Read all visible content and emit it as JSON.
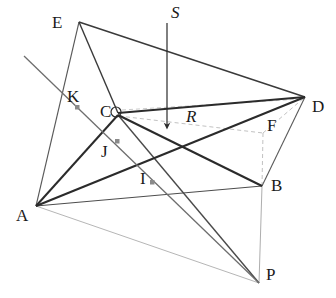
{
  "figure": {
    "type": "line-diagram",
    "width": 336,
    "height": 298,
    "background_color": "#ffffff",
    "colors": {
      "solid_line": "#2b2b2b",
      "thin_line": "#6b6b6b",
      "faint_line": "#b0b0b0",
      "dashed_line": "#bdbdbd",
      "marker_fill": "#8a8a8a",
      "label_color": "#1a1a1a"
    },
    "vertices": [
      {
        "name": "E",
        "label": "E",
        "x": 79,
        "y": 22,
        "label_x": 52,
        "label_y": 14,
        "kind": "apex"
      },
      {
        "name": "C",
        "label": "C",
        "x": 118,
        "y": 113,
        "label_x": 100,
        "label_y": 103,
        "kind": "corner"
      },
      {
        "name": "D",
        "label": "D",
        "x": 305,
        "y": 97,
        "label_x": 312,
        "label_y": 98,
        "kind": "corner"
      },
      {
        "name": "B",
        "label": "B",
        "x": 262,
        "y": 186,
        "label_x": 271,
        "label_y": 177,
        "kind": "corner"
      },
      {
        "name": "A",
        "label": "A",
        "x": 36,
        "y": 206,
        "label_x": 16,
        "label_y": 207,
        "kind": "corner"
      },
      {
        "name": "P",
        "label": "P",
        "x": 259,
        "y": 283,
        "label_x": 266,
        "label_y": 266,
        "kind": "corner"
      },
      {
        "name": "F",
        "label": "F",
        "x": 263,
        "y": 133,
        "label_x": 267,
        "label_y": 117,
        "kind": "hidden-corner"
      },
      {
        "name": "R",
        "label": "R",
        "x": 190,
        "y": 121,
        "label_x": 186,
        "label_y": 108,
        "kind": "point"
      },
      {
        "name": "S",
        "label": "S",
        "x": 167,
        "y": 23,
        "label_x": 171,
        "label_y": 4,
        "kind": "arrow-tail"
      }
    ],
    "interior_points": [
      {
        "name": "K",
        "label": "K",
        "x": 77,
        "y": 107,
        "label_x": 67,
        "label_y": 88,
        "marker": "gray-square"
      },
      {
        "name": "J",
        "label": "J",
        "x": 117,
        "y": 141,
        "label_x": 101,
        "label_y": 143,
        "marker": "gray-square"
      },
      {
        "name": "I",
        "label": "I",
        "x": 152,
        "y": 182,
        "label_x": 140,
        "label_y": 170,
        "marker": "gray-square"
      }
    ],
    "edges": [
      {
        "from": "E",
        "to": "D",
        "style": "solid",
        "weight": "medium"
      },
      {
        "from": "E",
        "to": "C",
        "style": "solid",
        "weight": "medium"
      },
      {
        "from": "E",
        "to": "A",
        "style": "solid",
        "weight": "thin"
      },
      {
        "from": "C",
        "to": "D",
        "style": "solid",
        "weight": "heavy"
      },
      {
        "from": "C",
        "to": "B",
        "style": "solid",
        "weight": "heavy"
      },
      {
        "from": "C",
        "to": "A",
        "style": "solid",
        "weight": "heavy"
      },
      {
        "from": "C",
        "to": "P",
        "style": "solid",
        "weight": "medium"
      },
      {
        "from": "A",
        "to": "D",
        "style": "solid",
        "weight": "heavy"
      },
      {
        "from": "A",
        "to": "B",
        "style": "solid",
        "weight": "thin"
      },
      {
        "from": "A",
        "to": "P",
        "style": "solid",
        "weight": "faint"
      },
      {
        "from": "D",
        "to": "B",
        "style": "solid",
        "weight": "thin"
      },
      {
        "from": "B",
        "to": "P",
        "style": "solid",
        "weight": "faint"
      },
      {
        "from": "B",
        "to": "F",
        "style": "dashed",
        "weight": "thin"
      },
      {
        "from": "C",
        "to": "F",
        "style": "dashed",
        "weight": "thin"
      },
      {
        "from": "F",
        "to": "D",
        "style": "dashed",
        "weight": "thin"
      }
    ],
    "cut_line": {
      "name": "oblique-cut-line",
      "description": "long straight line through interior points K, J and I ending at P",
      "x1": 24,
      "y1": 56,
      "x2": 259,
      "y2": 283
    },
    "arrow": {
      "name": "S-arrow",
      "label": "S",
      "description": "downward vertical arrow from S to the interior of the solid",
      "x1": 167,
      "y1": 23,
      "x2": 167,
      "y2": 131
    }
  }
}
